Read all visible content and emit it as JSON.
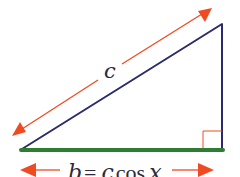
{
  "diagram": {
    "type": "right-triangle",
    "hypotenuse_label": "c",
    "base_label_parts": [
      "b",
      " = ",
      "c",
      "cos",
      " ",
      "x"
    ],
    "base_label": "b = c cos x",
    "colors": {
      "hypotenuse": "#2b2a6e",
      "vertical_side": "#2b2a6e",
      "base": "#2e7d32",
      "arrows": "#f04a23",
      "right_angle_marker": "#f04a23",
      "text": "#2a2a3a"
    }
  }
}
